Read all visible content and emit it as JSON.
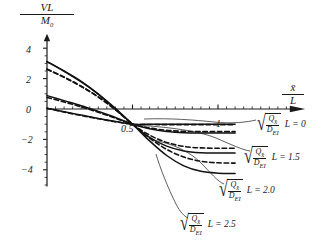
{
  "chart_data": {
    "type": "line",
    "title": "",
    "xlabel": "x̄/L",
    "ylabel": "VL/M0",
    "xlim": [
      0,
      1.18
    ],
    "ylim": [
      -5.2,
      4.8
    ],
    "grid": false,
    "legend_position": "right-outside",
    "x_ticks": [
      0.5,
      1
    ],
    "x_tick_labels": [
      "0.5",
      "1"
    ],
    "y_ticks": [
      4,
      2,
      0,
      -2,
      -4
    ],
    "y_tick_labels": [
      "4",
      "2",
      "0",
      "−2",
      "−4"
    ],
    "annotations": [
      "all curves converge near (0.5, -1)"
    ],
    "series": [
      {
        "name": "L = 0 (solid)",
        "style": "solid",
        "x": [
          0.0,
          0.1,
          0.2,
          0.3,
          0.4,
          0.5,
          0.6,
          0.7,
          0.8,
          0.9,
          1.0,
          1.1
        ],
        "y": [
          0.05,
          -0.18,
          -0.4,
          -0.62,
          -0.82,
          -1.0,
          -1.0,
          -1.0,
          -1.0,
          -1.0,
          -1.0,
          -1.0
        ]
      },
      {
        "name": "L = 0 (dashed)",
        "style": "dashed",
        "x": [
          0.0,
          0.1,
          0.2,
          0.3,
          0.4,
          0.5,
          0.6,
          0.7,
          0.8,
          0.9,
          1.0,
          1.1
        ],
        "y": [
          0.05,
          -0.2,
          -0.43,
          -0.64,
          -0.84,
          -1.0,
          -1.02,
          -1.03,
          -1.03,
          -1.03,
          -1.03,
          -1.03
        ]
      },
      {
        "name": "L = 1.5 (solid)",
        "style": "solid",
        "x": [
          0.0,
          0.1,
          0.2,
          0.3,
          0.4,
          0.5,
          0.6,
          0.7,
          0.8,
          0.9,
          1.0,
          1.1
        ],
        "y": [
          0.88,
          0.55,
          0.22,
          -0.16,
          -0.56,
          -1.0,
          -1.3,
          -1.48,
          -1.56,
          -1.58,
          -1.58,
          -1.58
        ]
      },
      {
        "name": "L = 1.5 (dashed)",
        "style": "dashed",
        "x": [
          0.0,
          0.1,
          0.2,
          0.3,
          0.4,
          0.5,
          0.6,
          0.7,
          0.8,
          0.9,
          1.0,
          1.1
        ],
        "y": [
          0.76,
          0.46,
          0.14,
          -0.22,
          -0.6,
          -1.0,
          -1.25,
          -1.4,
          -1.47,
          -1.49,
          -1.49,
          -1.49
        ]
      },
      {
        "name": "L = 2.0 (solid)",
        "style": "solid",
        "x": [
          0.0,
          0.1,
          0.2,
          0.3,
          0.4,
          0.5,
          0.6,
          0.7,
          0.8,
          0.9,
          1.0,
          1.1
        ],
        "y": [
          3.12,
          2.48,
          1.78,
          0.98,
          0.04,
          -1.0,
          -1.86,
          -2.44,
          -2.76,
          -2.88,
          -2.9,
          -2.9
        ]
      },
      {
        "name": "L = 2.0 (dashed)",
        "style": "dashed",
        "x": [
          0.0,
          0.1,
          0.2,
          0.3,
          0.4,
          0.5,
          0.6,
          0.7,
          0.8,
          0.9,
          1.0,
          1.1
        ],
        "y": [
          2.62,
          2.08,
          1.48,
          0.8,
          0.0,
          -1.0,
          -1.72,
          -2.2,
          -2.46,
          -2.56,
          -2.58,
          -2.58
        ]
      },
      {
        "name": "L = 2.5 (solid)",
        "style": "solid",
        "x": [
          0.0,
          0.1,
          0.2,
          0.3,
          0.4,
          0.5,
          0.6,
          0.7,
          0.8,
          0.9,
          1.0,
          1.1
        ],
        "y": [
          3.12,
          2.5,
          1.82,
          0.98,
          -0.02,
          -1.0,
          -2.1,
          -3.06,
          -3.74,
          -4.1,
          -4.22,
          -4.24
        ]
      },
      {
        "name": "L = 2.5 (dashed)",
        "style": "dashed",
        "x": [
          0.0,
          0.1,
          0.2,
          0.3,
          0.4,
          0.5,
          0.6,
          0.7,
          0.8,
          0.9,
          1.0,
          1.1
        ],
        "y": [
          2.62,
          2.1,
          1.5,
          0.78,
          -0.06,
          -1.0,
          -1.92,
          -2.66,
          -3.16,
          -3.44,
          -3.54,
          -3.56
        ]
      }
    ]
  },
  "axes": {
    "y_label_numerator": "VL",
    "y_label_denominator": "M",
    "y_label_den_sub": "0",
    "x_label_numerator": "x̄",
    "x_label_denominator": "L",
    "x_tick_05": "0.5",
    "x_tick_1": "1",
    "y_tick_4": "4",
    "y_tick_2": "2",
    "y_tick_0": "0",
    "y_tick_m2": "−2",
    "y_tick_m4": "−4"
  },
  "legend": {
    "items": [
      {
        "radical_numerator": "Q",
        "radical_num_sub": "x̄",
        "radical_denominator": "D",
        "radical_den_sub": "EI",
        "equation": "L = 0",
        "value": "0"
      },
      {
        "radical_numerator": "Q",
        "radical_num_sub": "x̄",
        "radical_denominator": "D",
        "radical_den_sub": "EI",
        "equation": "L = 1.5",
        "value": "1.5"
      },
      {
        "radical_numerator": "Q",
        "radical_num_sub": "x̄",
        "radical_denominator": "D",
        "radical_den_sub": "EI",
        "equation": "L = 2.0",
        "value": "2.0"
      },
      {
        "radical_numerator": "Q",
        "radical_num_sub": "x̄",
        "radical_denominator": "D",
        "radical_den_sub": "EI",
        "equation": "L = 2.5",
        "value": "2.5"
      }
    ]
  },
  "colors": {
    "axis": "#1a1a1a",
    "curve": "#111111",
    "text": "#1a1a1a",
    "background": "#ffffff"
  }
}
